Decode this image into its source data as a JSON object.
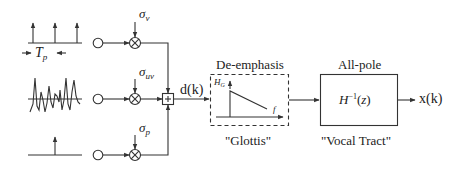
{
  "diagram": {
    "sources": {
      "voiced": {
        "period_label": "T",
        "period_sub": "p"
      },
      "unvoiced": {},
      "plosive": {}
    },
    "gains": {
      "voiced": {
        "symbol": "σ",
        "sub": "v"
      },
      "unvoiced": {
        "symbol": "σ",
        "sub": "uv"
      },
      "plosive": {
        "symbol": "σ",
        "sub": "p"
      }
    },
    "adder_symbol": "+",
    "excitation_label": "d(k)",
    "glottis": {
      "title": "De-emphasis",
      "caption": "\"Glottis\"",
      "y_axis": "H",
      "y_sub": "G",
      "x_axis": "f"
    },
    "vocal_tract": {
      "title": "All-pole",
      "caption": "\"Vocal Tract\"",
      "transfer_base": "H",
      "transfer_sup": "−1",
      "transfer_arg": "(z)"
    },
    "output_label": "x(k)",
    "colors": {
      "stroke": "#333333",
      "background": "#ffffff"
    }
  }
}
